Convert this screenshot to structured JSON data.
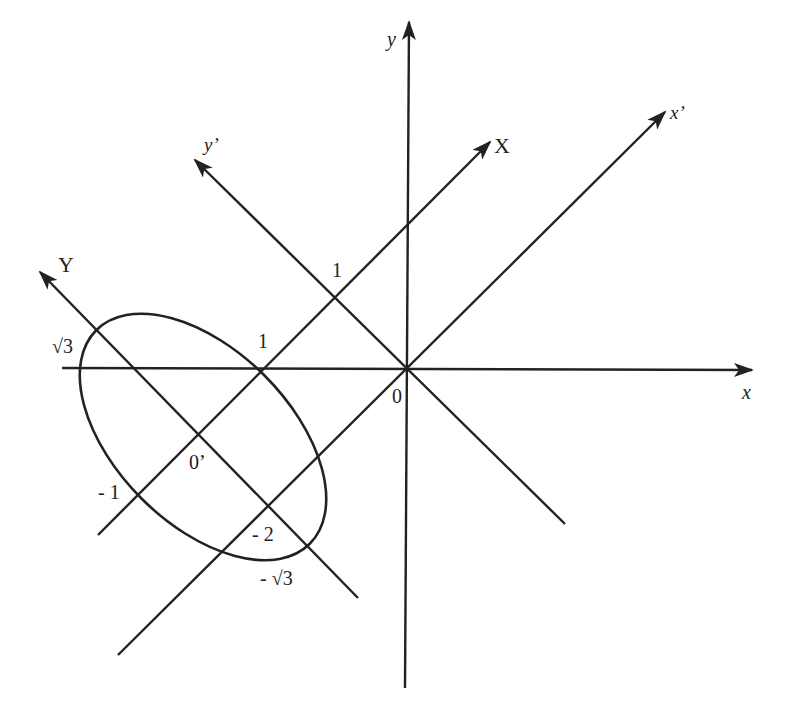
{
  "diagram": {
    "colors": {
      "stroke": "#222222",
      "background": "#ffffff"
    },
    "axes": [
      {
        "id": "x",
        "label": "x",
        "x1": 62,
        "y1": 368,
        "x2": 752,
        "y2": 370
      },
      {
        "id": "y",
        "label": "y",
        "x1": 405,
        "y1": 688,
        "x2": 409,
        "y2": 22
      },
      {
        "id": "x-prime",
        "label": "x’",
        "x1": 118,
        "y1": 655,
        "x2": 665,
        "y2": 112
      },
      {
        "id": "y-prime",
        "label": "y’",
        "x1": 565,
        "y1": 524,
        "x2": 195,
        "y2": 160
      },
      {
        "id": "X",
        "label": "X",
        "x1": 98,
        "y1": 535,
        "x2": 490,
        "y2": 142
      },
      {
        "id": "Y",
        "label": "Y",
        "x1": 358,
        "y1": 598,
        "x2": 40,
        "y2": 272
      }
    ],
    "ellipse": {
      "cx": 203,
      "cy": 437,
      "rx": 151,
      "ry": 87,
      "rotate": 45
    },
    "labels": {
      "y_axis": "y",
      "x_axis": "x",
      "x_prime": "x’",
      "y_prime": "y’",
      "X_axis": "X",
      "Y_axis": "Y",
      "origin": "0",
      "origin_prime": "0’",
      "one_on_x": "1",
      "one_on_y_prime": "1",
      "sqrt3": "√3",
      "neg_one": "- 1",
      "neg_two": "- 2",
      "neg_sqrt3": "- √3"
    }
  }
}
